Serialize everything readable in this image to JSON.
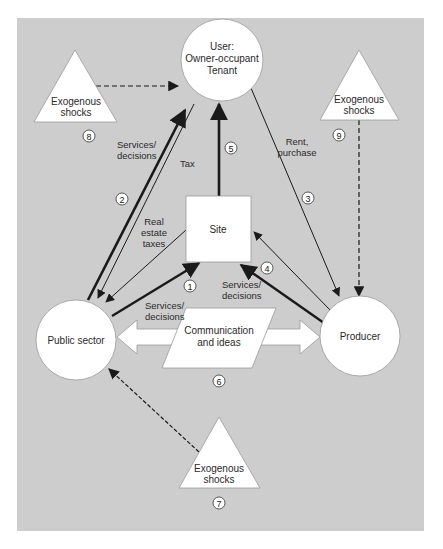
{
  "diagram": {
    "background_color": "#cdcdcd",
    "nodes": {
      "user": {
        "lines": [
          "User:",
          "Owner-occupant",
          "Tenant"
        ]
      },
      "site": {
        "label": "Site"
      },
      "public_sector": {
        "label": "Public sector"
      },
      "producer": {
        "label": "Producer"
      },
      "communication": {
        "lines": [
          "Communication",
          "and ideas"
        ]
      },
      "shock_top_left": {
        "lines": [
          "Exogenous",
          "shocks"
        ],
        "number": "8"
      },
      "shock_top_right": {
        "lines": [
          "Exogenous",
          "shocks"
        ],
        "number": "9"
      },
      "shock_bottom": {
        "lines": [
          "Exogenous",
          "shocks"
        ],
        "number": "7"
      }
    },
    "edge_labels": {
      "services_decisions_2": [
        "Services/",
        "decisions"
      ],
      "tax": "Tax",
      "real_estate_taxes": [
        "Real",
        "estate",
        "taxes"
      ],
      "rent_purchase": [
        "Rent,",
        "purchase"
      ],
      "services_decisions_1": [
        "Services/",
        "decisions"
      ],
      "services_decisions_4": [
        "Services/",
        "decisions"
      ]
    },
    "edge_numbers": {
      "n1": "1",
      "n2": "2",
      "n3": "3",
      "n4": "4",
      "n5": "5",
      "n6": "6"
    }
  },
  "caption": ""
}
